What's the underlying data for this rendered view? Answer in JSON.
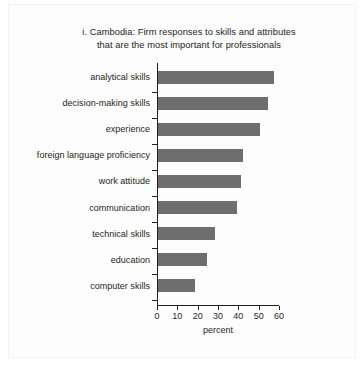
{
  "figure": {
    "title_line_1": "i. Cambodia: Firm responses to skills and attributes",
    "title_line_2": "that are the most important for professionals",
    "bar_color": "#6e6e6e",
    "axis_color": "#231f20",
    "background": "#ffffff"
  },
  "chart_data": {
    "type": "bar",
    "orientation": "horizontal",
    "title": "i. Cambodia: Firm responses to skills and attributes that are the most important for professionals",
    "xlabel": "percent",
    "ylabel": "",
    "xlim": [
      0,
      60
    ],
    "xticks": [
      0,
      10,
      20,
      30,
      40,
      50,
      60
    ],
    "xtick_labels": [
      "0",
      "10",
      "20",
      "30",
      "40",
      "50",
      "60"
    ],
    "grid": false,
    "legend": null,
    "categories": [
      "analytical skills",
      "decision-making skills",
      "experience",
      "foreign language proficiency",
      "work attitude",
      "technical skills",
      "education",
      "computer skills",
      "communication"
    ],
    "series": [
      {
        "name": "percent of firm responses",
        "categories": [
          "analytical skills",
          "decision-making skills",
          "experience",
          "foreign language proficiency",
          "work attitude",
          "communication",
          "technical skills",
          "education",
          "computer skills"
        ],
        "values": [
          57,
          54,
          50,
          42,
          41,
          39,
          28,
          24,
          18
        ]
      }
    ],
    "bars": [
      {
        "label": "analytical skills",
        "value": 57
      },
      {
        "label": "decision-making skills",
        "value": 54
      },
      {
        "label": "experience",
        "value": 50
      },
      {
        "label": "foreign language proficiency",
        "value": 42
      },
      {
        "label": "work attitude",
        "value": 41
      },
      {
        "label": "communication",
        "value": 39
      },
      {
        "label": "technical skills",
        "value": 28
      },
      {
        "label": "education",
        "value": 24
      },
      {
        "label": "computer skills",
        "value": 18
      }
    ]
  }
}
